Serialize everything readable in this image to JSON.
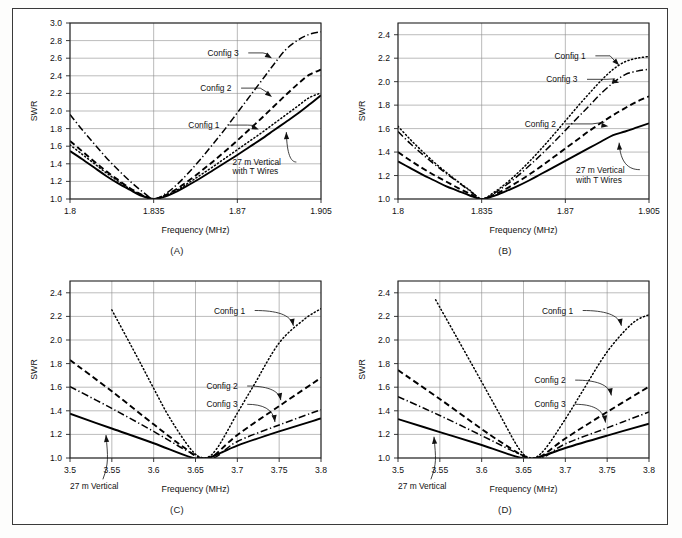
{
  "figure": {
    "panel_captions": [
      "(A)",
      "(B)",
      "(C)",
      "(D)"
    ],
    "axis_titles": {
      "x": "Frequency (MHz)",
      "y": "SWR"
    },
    "series_labels": {
      "config1": "Config 1",
      "config2": "Config 2",
      "config3": "Config 3",
      "baseline_160": "27 m Vertical\nwith T Wires",
      "baseline_160_line1": "27 m Vertical",
      "baseline_160_line2": "with T Wires",
      "baseline_80": "27 m Vertical"
    },
    "colors": {
      "ink": "#000000",
      "grid": "#8d8d8d",
      "frame": "#222222",
      "page": "#ffffff"
    }
  },
  "chart_data": [
    {
      "id": "A",
      "type": "line",
      "title": "(A)",
      "xlabel": "Frequency (MHz)",
      "ylabel": "SWR",
      "xlim": [
        1.8,
        1.905
      ],
      "ylim": [
        1.0,
        3.0
      ],
      "xticks": [
        1.8,
        1.835,
        1.87,
        1.905
      ],
      "xticklabels": [
        "1.8",
        "1.835",
        "1.87",
        "1.905"
      ],
      "yticks": [
        1.0,
        1.2,
        1.4,
        1.6,
        1.8,
        2.0,
        2.2,
        2.4,
        2.6,
        2.8,
        3.0
      ],
      "yticklabels": [
        "1.0",
        "1.2",
        "1.4",
        "1.6",
        "1.8",
        "2.0",
        "2.2",
        "2.4",
        "2.6",
        "2.8",
        "3.0"
      ],
      "grid": true,
      "legend": "annotations",
      "series": [
        {
          "name": "27 m Vertical with T Wires",
          "style": "base",
          "x": [
            1.8,
            1.805,
            1.81,
            1.815,
            1.82,
            1.825,
            1.83,
            1.835,
            1.84,
            1.845,
            1.85,
            1.855,
            1.86,
            1.865,
            1.87,
            1.875,
            1.88,
            1.885,
            1.89,
            1.895,
            1.9,
            1.905
          ],
          "y": [
            1.545,
            1.455,
            1.36,
            1.265,
            1.18,
            1.105,
            1.035,
            1.0,
            1.03,
            1.09,
            1.165,
            1.245,
            1.33,
            1.415,
            1.5,
            1.59,
            1.68,
            1.775,
            1.87,
            1.965,
            2.07,
            2.18
          ]
        },
        {
          "name": "Config 1",
          "style": "cfg1",
          "x": [
            1.8,
            1.805,
            1.81,
            1.815,
            1.82,
            1.825,
            1.83,
            1.835,
            1.84,
            1.845,
            1.85,
            1.855,
            1.86,
            1.865,
            1.87,
            1.875,
            1.88,
            1.885,
            1.89,
            1.895,
            1.9,
            1.905
          ],
          "y": [
            1.615,
            1.51,
            1.405,
            1.3,
            1.205,
            1.115,
            1.045,
            1.0,
            1.04,
            1.105,
            1.19,
            1.28,
            1.37,
            1.465,
            1.56,
            1.655,
            1.75,
            1.85,
            1.95,
            2.05,
            2.15,
            2.205
          ]
        },
        {
          "name": "Config 2",
          "style": "cfg2",
          "x": [
            1.8,
            1.805,
            1.81,
            1.815,
            1.82,
            1.825,
            1.83,
            1.835,
            1.84,
            1.845,
            1.85,
            1.855,
            1.86,
            1.865,
            1.87,
            1.875,
            1.88,
            1.885,
            1.89,
            1.895,
            1.9,
            1.905
          ],
          "y": [
            1.66,
            1.545,
            1.43,
            1.32,
            1.22,
            1.125,
            1.05,
            1.0,
            1.045,
            1.12,
            1.215,
            1.32,
            1.43,
            1.545,
            1.665,
            1.79,
            1.915,
            2.045,
            2.175,
            2.3,
            2.41,
            2.47
          ]
        },
        {
          "name": "Config 3",
          "style": "cfg3",
          "x": [
            1.8,
            1.805,
            1.81,
            1.815,
            1.82,
            1.825,
            1.83,
            1.835,
            1.84,
            1.845,
            1.85,
            1.855,
            1.86,
            1.865,
            1.87,
            1.875,
            1.88,
            1.885,
            1.89,
            1.895,
            1.9,
            1.905
          ],
          "y": [
            1.96,
            1.79,
            1.63,
            1.475,
            1.335,
            1.205,
            1.09,
            1.0,
            1.06,
            1.17,
            1.31,
            1.465,
            1.63,
            1.8,
            1.98,
            2.16,
            2.34,
            2.52,
            2.69,
            2.8,
            2.87,
            2.9
          ]
        }
      ],
      "annotations": [
        {
          "text": "Config 3",
          "tx": 1.8575,
          "ty": 2.66,
          "ax": 1.8845,
          "ay": 2.6,
          "kind": "straight"
        },
        {
          "text": "Config 2",
          "tx": 1.8545,
          "ty": 2.26,
          "ax": 1.8845,
          "ay": 2.16,
          "kind": "straight"
        },
        {
          "text": "Config 1",
          "tx": 1.8495,
          "ty": 1.84,
          "ax": 1.879,
          "ay": 1.79,
          "kind": "straight"
        },
        {
          "text": "27 m Vertical",
          "tx": 1.868,
          "ty": 1.42,
          "ax": 1.8905,
          "ay": 1.76,
          "kind": "curve"
        },
        {
          "text": "with T Wires",
          "tx": 1.868,
          "ty": 1.32,
          "ax": null,
          "ay": null,
          "kind": "text"
        }
      ]
    },
    {
      "id": "B",
      "type": "line",
      "title": "(B)",
      "xlabel": "Frequency (MHz)",
      "ylabel": "SWR",
      "xlim": [
        1.8,
        1.905
      ],
      "ylim": [
        1.0,
        2.5
      ],
      "xticks": [
        1.8,
        1.835,
        1.87,
        1.905
      ],
      "xticklabels": [
        "1.8",
        "1.835",
        "1.87",
        "1.905"
      ],
      "yticks": [
        1.0,
        1.2,
        1.4,
        1.6,
        1.8,
        2.0,
        2.2,
        2.4
      ],
      "yticklabels": [
        "1.0",
        "1.2",
        "1.4",
        "1.6",
        "1.8",
        "2.0",
        "2.2",
        "2.4"
      ],
      "grid": true,
      "legend": "annotations",
      "series": [
        {
          "name": "27 m Vertical with T Wires",
          "style": "base",
          "x": [
            1.8,
            1.805,
            1.81,
            1.815,
            1.82,
            1.825,
            1.83,
            1.835,
            1.84,
            1.845,
            1.85,
            1.855,
            1.86,
            1.865,
            1.87,
            1.875,
            1.88,
            1.885,
            1.89,
            1.895,
            1.9,
            1.905
          ],
          "y": [
            1.32,
            1.265,
            1.21,
            1.16,
            1.11,
            1.07,
            1.03,
            1.0,
            1.025,
            1.065,
            1.11,
            1.16,
            1.215,
            1.27,
            1.325,
            1.38,
            1.435,
            1.49,
            1.545,
            1.575,
            1.61,
            1.645
          ]
        },
        {
          "name": "Config 2",
          "style": "cfg2",
          "x": [
            1.8,
            1.805,
            1.81,
            1.815,
            1.82,
            1.825,
            1.83,
            1.835,
            1.84,
            1.845,
            1.85,
            1.855,
            1.86,
            1.865,
            1.87,
            1.875,
            1.88,
            1.885,
            1.89,
            1.895,
            1.9,
            1.905
          ],
          "y": [
            1.4,
            1.33,
            1.265,
            1.205,
            1.15,
            1.095,
            1.045,
            1.0,
            1.035,
            1.085,
            1.145,
            1.21,
            1.28,
            1.355,
            1.43,
            1.505,
            1.58,
            1.65,
            1.715,
            1.775,
            1.83,
            1.875
          ]
        },
        {
          "name": "Config 3",
          "style": "cfg3",
          "x": [
            1.8,
            1.805,
            1.81,
            1.815,
            1.82,
            1.825,
            1.83,
            1.835,
            1.84,
            1.845,
            1.85,
            1.855,
            1.86,
            1.865,
            1.87,
            1.875,
            1.88,
            1.885,
            1.89,
            1.895,
            1.9,
            1.905
          ],
          "y": [
            1.575,
            1.475,
            1.385,
            1.3,
            1.22,
            1.145,
            1.07,
            1.0,
            1.045,
            1.115,
            1.195,
            1.285,
            1.38,
            1.48,
            1.585,
            1.69,
            1.795,
            1.9,
            1.99,
            2.06,
            2.09,
            2.105
          ]
        },
        {
          "name": "Config 1",
          "style": "cfg1",
          "x": [
            1.8,
            1.805,
            1.81,
            1.815,
            1.82,
            1.825,
            1.83,
            1.835,
            1.84,
            1.845,
            1.85,
            1.855,
            1.86,
            1.865,
            1.87,
            1.875,
            1.88,
            1.885,
            1.89,
            1.895,
            1.9,
            1.905
          ],
          "y": [
            1.62,
            1.51,
            1.41,
            1.315,
            1.23,
            1.15,
            1.075,
            1.0,
            1.055,
            1.13,
            1.22,
            1.32,
            1.43,
            1.545,
            1.665,
            1.785,
            1.9,
            2.01,
            2.105,
            2.17,
            2.2,
            2.215
          ]
        }
      ],
      "annotations": [
        {
          "text": "Config 1",
          "tx": 1.8655,
          "ty": 2.22,
          "ax": 1.8925,
          "ay": 2.14,
          "kind": "straight"
        },
        {
          "text": "Config 3",
          "tx": 1.862,
          "ty": 2.02,
          "ax": 1.8925,
          "ay": 1.99,
          "kind": "straight"
        },
        {
          "text": "Config 2",
          "tx": 1.853,
          "ty": 1.64,
          "ax": 1.888,
          "ay": 1.62,
          "kind": "straight"
        },
        {
          "text": "27 m Vertical",
          "tx": 1.8745,
          "ty": 1.25,
          "ax": 1.8925,
          "ay": 1.48,
          "kind": "curve"
        },
        {
          "text": "with T Wires",
          "tx": 1.8745,
          "ty": 1.165,
          "ax": null,
          "ay": null,
          "kind": "text"
        }
      ]
    },
    {
      "id": "C",
      "type": "line",
      "title": "(C)",
      "xlabel": "Frequency (MHz)",
      "ylabel": "SWR",
      "xlim": [
        3.5,
        3.8
      ],
      "ylim": [
        1.0,
        2.5
      ],
      "xticks": [
        3.5,
        3.55,
        3.6,
        3.65,
        3.7,
        3.75,
        3.8
      ],
      "xticklabels": [
        "3.5",
        "3.55",
        "3.6",
        "3.65",
        "3.7",
        "3.75",
        "3.8"
      ],
      "yticks": [
        1.0,
        1.2,
        1.4,
        1.6,
        1.8,
        2.0,
        2.2,
        2.4
      ],
      "yticklabels": [
        "1.0",
        "1.2",
        "1.4",
        "1.6",
        "1.8",
        "2.0",
        "2.2",
        "2.4"
      ],
      "grid": true,
      "legend": "annotations",
      "series": [
        {
          "name": "27 m Vertical",
          "style": "base",
          "x": [
            3.5,
            3.55,
            3.6,
            3.645,
            3.665,
            3.7,
            3.75,
            3.8
          ],
          "y": [
            1.375,
            1.25,
            1.125,
            1.005,
            1.0,
            1.105,
            1.225,
            1.335
          ]
        },
        {
          "name": "Config 2",
          "style": "cfg2",
          "x": [
            3.5,
            3.55,
            3.6,
            3.635,
            3.655,
            3.67,
            3.7,
            3.75,
            3.8
          ],
          "y": [
            1.83,
            1.565,
            1.285,
            1.095,
            1.0,
            1.01,
            1.195,
            1.44,
            1.68
          ]
        },
        {
          "name": "Config 3",
          "style": "cfg3",
          "x": [
            3.5,
            3.55,
            3.6,
            3.64,
            3.66,
            3.675,
            3.7,
            3.75,
            3.8
          ],
          "y": [
            1.605,
            1.42,
            1.225,
            1.06,
            1.0,
            1.012,
            1.14,
            1.28,
            1.41
          ]
        },
        {
          "name": "Config 1",
          "style": "cfg1",
          "x": [
            3.55,
            3.58,
            3.6,
            3.62,
            3.645,
            3.66,
            3.675,
            3.7,
            3.72,
            3.75,
            3.78,
            3.8
          ],
          "y": [
            2.255,
            1.86,
            1.59,
            1.33,
            1.07,
            1.0,
            1.075,
            1.38,
            1.62,
            1.975,
            2.175,
            2.265
          ]
        }
      ],
      "annotations": [
        {
          "text": "Config 1",
          "tx": 3.672,
          "ty": 2.25,
          "ax": 3.767,
          "ay": 2.12,
          "kind": "curve"
        },
        {
          "text": "Config 2",
          "tx": 3.663,
          "ty": 1.61,
          "ax": 3.752,
          "ay": 1.49,
          "kind": "curve"
        },
        {
          "text": "Config 3",
          "tx": 3.663,
          "ty": 1.455,
          "ax": 3.745,
          "ay": 1.305,
          "kind": "curve"
        },
        {
          "text": "27 m Vertical",
          "tx": 3.5,
          "ty": 0.76,
          "ax": 3.543,
          "ay": 1.195,
          "kind": "curve-out"
        }
      ]
    },
    {
      "id": "D",
      "type": "line",
      "title": "(D)",
      "xlabel": "Frequency (MHz)",
      "ylabel": "SWR",
      "xlim": [
        3.5,
        3.8
      ],
      "ylim": [
        1.0,
        2.5
      ],
      "xticks": [
        3.5,
        3.55,
        3.6,
        3.65,
        3.7,
        3.75,
        3.8
      ],
      "xticklabels": [
        "3.5",
        "3.55",
        "3.6",
        "3.65",
        "3.7",
        "3.75",
        "3.8"
      ],
      "yticks": [
        1.0,
        1.2,
        1.4,
        1.6,
        1.8,
        2.0,
        2.2,
        2.4
      ],
      "yticklabels": [
        "1.0",
        "1.2",
        "1.4",
        "1.6",
        "1.8",
        "2.0",
        "2.2",
        "2.4"
      ],
      "grid": true,
      "legend": "annotations",
      "series": [
        {
          "name": "27 m Vertical",
          "style": "base",
          "x": [
            3.5,
            3.55,
            3.6,
            3.645,
            3.665,
            3.7,
            3.75,
            3.8
          ],
          "y": [
            1.33,
            1.22,
            1.11,
            1.005,
            1.0,
            1.085,
            1.19,
            1.29
          ]
        },
        {
          "name": "Config 2",
          "style": "cfg2",
          "x": [
            3.5,
            3.55,
            3.6,
            3.635,
            3.655,
            3.67,
            3.7,
            3.75,
            3.8
          ],
          "y": [
            1.745,
            1.5,
            1.245,
            1.08,
            1.0,
            1.01,
            1.165,
            1.39,
            1.605
          ]
        },
        {
          "name": "Config 3",
          "style": "cfg3",
          "x": [
            3.5,
            3.55,
            3.6,
            3.64,
            3.66,
            3.675,
            3.7,
            3.75,
            3.8
          ],
          "y": [
            1.52,
            1.36,
            1.19,
            1.05,
            1.0,
            1.01,
            1.12,
            1.255,
            1.39
          ]
        },
        {
          "name": "Config 1",
          "style": "cfg1",
          "x": [
            3.545,
            3.57,
            3.6,
            3.62,
            3.645,
            3.66,
            3.675,
            3.7,
            3.72,
            3.75,
            3.78,
            3.8
          ],
          "y": [
            2.34,
            2.025,
            1.645,
            1.39,
            1.075,
            1.0,
            1.07,
            1.33,
            1.56,
            1.9,
            2.14,
            2.215
          ]
        }
      ],
      "annotations": [
        {
          "text": "Config 1",
          "tx": 3.672,
          "ty": 2.25,
          "ax": 3.767,
          "ay": 2.12,
          "kind": "curve"
        },
        {
          "text": "Config 2",
          "tx": 3.663,
          "ty": 1.66,
          "ax": 3.755,
          "ay": 1.53,
          "kind": "curve"
        },
        {
          "text": "Config 3",
          "tx": 3.663,
          "ty": 1.455,
          "ax": 3.748,
          "ay": 1.3,
          "kind": "curve"
        },
        {
          "text": "27 m Vertical",
          "tx": 3.5,
          "ty": 0.76,
          "ax": 3.543,
          "ay": 1.18,
          "kind": "curve-out"
        }
      ]
    }
  ]
}
